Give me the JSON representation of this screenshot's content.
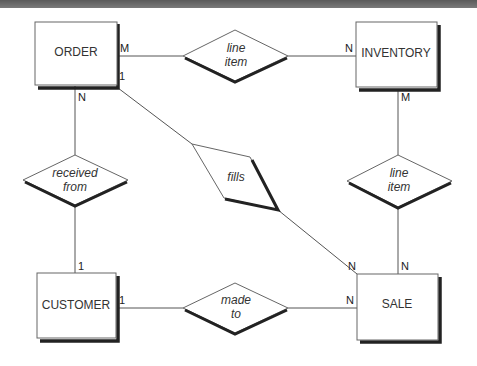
{
  "diagram": {
    "type": "entity-relationship",
    "entities": [
      {
        "id": "order",
        "label": "ORDER"
      },
      {
        "id": "inventory",
        "label": "INVENTORY"
      },
      {
        "id": "customer",
        "label": "CUSTOMER"
      },
      {
        "id": "sale",
        "label": "SALE"
      }
    ],
    "relationships": [
      {
        "id": "line_item_top",
        "line1": "line",
        "line2": "item",
        "from": "ORDER",
        "to": "INVENTORY",
        "from_card": "M",
        "to_card": "N"
      },
      {
        "id": "received_from",
        "line1": "received",
        "line2": "from",
        "from": "ORDER",
        "to": "CUSTOMER",
        "from_card": "N",
        "to_card": "1"
      },
      {
        "id": "fills",
        "line1": "fills",
        "from": "ORDER",
        "to": "SALE",
        "from_card": "1",
        "to_card": "N"
      },
      {
        "id": "line_item_right",
        "line1": "line",
        "line2": "item",
        "from": "INVENTORY",
        "to": "SALE",
        "from_card": "M",
        "to_card": "N"
      },
      {
        "id": "made_to",
        "line1": "made",
        "line2": "to",
        "from": "CUSTOMER",
        "to": "SALE",
        "from_card": "1",
        "to_card": "N"
      }
    ]
  }
}
